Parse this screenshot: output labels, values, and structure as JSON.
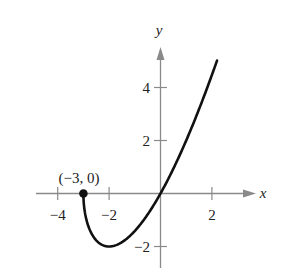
{
  "chart_data": {
    "type": "line",
    "title": "",
    "function": "f(x) = x*sqrt(x+3)",
    "xlabel": "x",
    "ylabel": "y",
    "xlim": [
      -4.7,
      3.6
    ],
    "ylim": [
      -2.8,
      5.7
    ],
    "x_ticks": [
      -4,
      -2,
      2
    ],
    "x_tick_labels": [
      "−4",
      "−2",
      "2"
    ],
    "y_ticks": [
      -2,
      2,
      4
    ],
    "y_tick_labels": [
      "−2",
      "2",
      "4"
    ],
    "grid": false,
    "legend": null,
    "series": [
      {
        "name": "curve",
        "x": [
          -3,
          -2.9,
          -2.75,
          -2.5,
          -2.25,
          -2,
          -1.75,
          -1.5,
          -1.25,
          -1,
          -0.5,
          0,
          0.5,
          1,
          1.5,
          2,
          2.2
        ],
        "y": [
          0,
          -0.92,
          -1.38,
          -1.77,
          -1.95,
          -2,
          -1.96,
          -1.84,
          -1.65,
          -1.41,
          -0.79,
          0,
          0.94,
          2.0,
          3.18,
          4.47,
          5.02
        ]
      }
    ],
    "annotations": [
      {
        "text": "(−3, 0)",
        "point": [
          -3,
          0
        ],
        "marker": "filled-circle"
      }
    ]
  },
  "labels": {
    "x_axis": "x",
    "y_axis": "y",
    "point": "(−3, 0)",
    "tick_x_neg4": "−4",
    "tick_x_neg2": "−2",
    "tick_x_2": "2",
    "tick_y_4": "4",
    "tick_y_2": "2",
    "tick_y_neg2": "−2"
  },
  "colors": {
    "axis": "#8a8a8a",
    "curve": "#111111",
    "text": "#222222"
  }
}
